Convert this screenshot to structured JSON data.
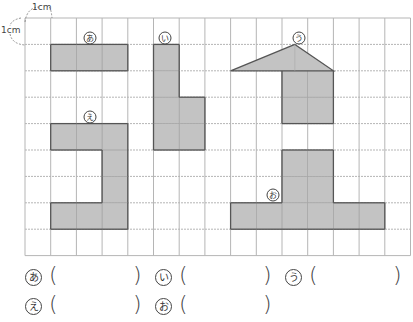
{
  "unit_labels": {
    "top": "1cm",
    "left": "1cm"
  },
  "grid": {
    "x0": 25,
    "y0": 18,
    "cols": 15,
    "rows": 9,
    "cell_w": 25.7,
    "cell_h": 26.4,
    "line_color": "#b5b5b5",
    "border_color": "#9a9a9a"
  },
  "shape_style": {
    "fill": "#c3c3c3",
    "stroke": "#555555"
  },
  "shapes": [
    {
      "id": "a",
      "label": "あ",
      "label_pos": [
        90,
        38
      ],
      "cells": [
        [
          1,
          1
        ],
        [
          2,
          1
        ],
        [
          3,
          1
        ]
      ]
    },
    {
      "id": "i",
      "label": "い",
      "label_pos": [
        165,
        38
      ],
      "cells": [
        [
          5,
          1
        ],
        [
          5,
          2
        ],
        [
          5,
          3
        ],
        [
          5,
          4
        ],
        [
          6,
          3
        ],
        [
          6,
          4
        ]
      ]
    },
    {
      "id": "u",
      "label": "う",
      "label_pos": [
        299,
        38
      ],
      "cells": [
        [
          10,
          2
        ],
        [
          11,
          2
        ],
        [
          10,
          3
        ],
        [
          11,
          3
        ]
      ],
      "triangle": {
        "apex": [
          10.5,
          1
        ],
        "base_left": [
          8,
          2
        ],
        "base_right": [
          12,
          2
        ]
      }
    },
    {
      "id": "e",
      "label": "え",
      "label_pos": [
        90,
        117
      ],
      "cells": [
        [
          1,
          4
        ],
        [
          2,
          4
        ],
        [
          3,
          4
        ],
        [
          3,
          5
        ],
        [
          3,
          6
        ],
        [
          1,
          7
        ],
        [
          2,
          7
        ],
        [
          3,
          7
        ]
      ]
    },
    {
      "id": "o",
      "label": "お",
      "label_pos": [
        273,
        195
      ],
      "cells": [
        [
          10,
          5
        ],
        [
          11,
          5
        ],
        [
          10,
          6
        ],
        [
          11,
          6
        ],
        [
          8,
          7
        ],
        [
          9,
          7
        ],
        [
          10,
          7
        ],
        [
          11,
          7
        ],
        [
          12,
          7
        ],
        [
          13,
          7
        ]
      ]
    }
  ],
  "answers": {
    "rows": [
      [
        {
          "mark": "あ",
          "value": ""
        },
        {
          "mark": "い",
          "value": ""
        },
        {
          "mark": "う",
          "value": ""
        }
      ],
      [
        {
          "mark": "え",
          "value": ""
        },
        {
          "mark": "お",
          "value": ""
        }
      ]
    ],
    "open_paren": "(",
    "close_paren": ")"
  }
}
